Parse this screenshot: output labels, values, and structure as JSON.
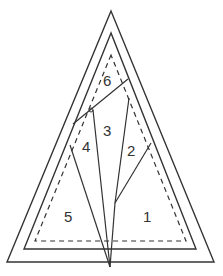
{
  "diagram": {
    "type": "foundation-paper-piecing-pattern",
    "shape": "triangle",
    "colors": {
      "line": "#333333",
      "background": "#ffffff"
    },
    "outlines": {
      "outer": "solid",
      "middle": "solid",
      "inner": "dashed"
    },
    "sections": [
      {
        "id": "1",
        "label": "1"
      },
      {
        "id": "2",
        "label": "2"
      },
      {
        "id": "3",
        "label": "3"
      },
      {
        "id": "4",
        "label": "4"
      },
      {
        "id": "5",
        "label": "5"
      },
      {
        "id": "6",
        "label": "6"
      }
    ]
  }
}
